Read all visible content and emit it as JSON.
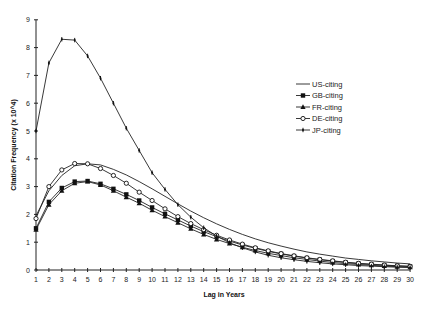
{
  "chart_data": {
    "type": "line",
    "title": "",
    "xlabel": "Lag in Years",
    "ylabel": "Citation Frequency (x 10^4)",
    "ylim": [
      0,
      9
    ],
    "xlim": [
      1,
      30
    ],
    "yticks": [
      0,
      1,
      2,
      3,
      4,
      5,
      6,
      7,
      8,
      9
    ],
    "grid": false,
    "legend_position": "right",
    "x": [
      1,
      2,
      3,
      4,
      5,
      6,
      7,
      8,
      9,
      10,
      11,
      12,
      13,
      14,
      15,
      16,
      17,
      18,
      19,
      20,
      21,
      22,
      23,
      24,
      25,
      26,
      27,
      28,
      29,
      30
    ],
    "series": [
      {
        "name": "US-citing",
        "marker": "none",
        "values": [
          1.95,
          2.85,
          3.4,
          3.75,
          3.82,
          3.78,
          3.62,
          3.42,
          3.18,
          2.92,
          2.65,
          2.38,
          2.12,
          1.88,
          1.66,
          1.46,
          1.28,
          1.12,
          0.98,
          0.86,
          0.75,
          0.65,
          0.57,
          0.5,
          0.43,
          0.38,
          0.33,
          0.29,
          0.25,
          0.22
        ]
      },
      {
        "name": "GB-citing",
        "marker": "filled-square",
        "values": [
          1.5,
          2.45,
          2.95,
          3.18,
          3.2,
          3.1,
          2.92,
          2.72,
          2.5,
          2.25,
          2.02,
          1.8,
          1.58,
          1.38,
          1.2,
          1.04,
          0.9,
          0.78,
          0.67,
          0.58,
          0.5,
          0.43,
          0.37,
          0.32,
          0.27,
          0.23,
          0.2,
          0.17,
          0.15,
          0.13
        ]
      },
      {
        "name": "FR-citing",
        "marker": "filled-triangle",
        "values": [
          1.45,
          2.35,
          2.85,
          3.12,
          3.18,
          3.06,
          2.85,
          2.62,
          2.4,
          2.15,
          1.92,
          1.7,
          1.48,
          1.28,
          1.1,
          0.95,
          0.82,
          0.7,
          0.6,
          0.52,
          0.44,
          0.38,
          0.32,
          0.27,
          0.23,
          0.2,
          0.17,
          0.14,
          0.12,
          0.1
        ]
      },
      {
        "name": "DE-citing",
        "marker": "open-circle",
        "values": [
          1.85,
          3.0,
          3.6,
          3.83,
          3.82,
          3.65,
          3.4,
          3.12,
          2.8,
          2.5,
          2.2,
          1.92,
          1.67,
          1.45,
          1.25,
          1.08,
          0.93,
          0.8,
          0.69,
          0.59,
          0.51,
          0.44,
          0.38,
          0.33,
          0.28,
          0.24,
          0.21,
          0.18,
          0.15,
          0.13
        ]
      },
      {
        "name": "JP-citing",
        "marker": "plus-tick",
        "values": [
          5.0,
          7.45,
          8.3,
          8.27,
          7.7,
          6.9,
          6.0,
          5.1,
          4.3,
          3.5,
          2.9,
          2.35,
          1.9,
          1.52,
          1.22,
          0.98,
          0.8,
          0.65,
          0.53,
          0.44,
          0.37,
          0.31,
          0.26,
          0.22,
          0.19,
          0.16,
          0.14,
          0.12,
          0.1,
          0.09
        ]
      }
    ]
  }
}
